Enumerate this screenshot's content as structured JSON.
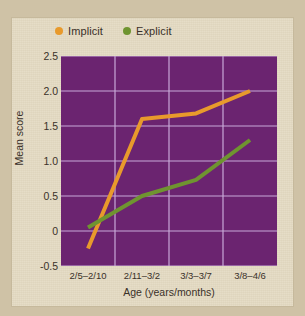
{
  "chart_data": {
    "type": "line",
    "title": "",
    "xlabel": "Age (years/months)",
    "ylabel": "Mean score",
    "categories": [
      "2/5–2/10",
      "2/11–3/2",
      "3/3–3/7",
      "3/8–4/6"
    ],
    "yticks": [
      "2.5",
      "2.0",
      "1.5",
      "1.0",
      "0.5",
      "0",
      "-0.5"
    ],
    "ytick_values": [
      2.5,
      2.0,
      1.5,
      1.0,
      0.5,
      0,
      -0.5
    ],
    "ylim": [
      -0.5,
      2.5
    ],
    "grid": true,
    "legend_position": "top-left",
    "plot_background": "#6b2470",
    "grid_color": "#c8a8d8",
    "series": [
      {
        "name": "Implicit",
        "color": "#e89a2c",
        "values": [
          -0.25,
          1.6,
          1.68,
          2.0
        ]
      },
      {
        "name": "Explicit",
        "color": "#6f9430",
        "values": [
          0.05,
          0.5,
          0.73,
          1.3
        ]
      }
    ]
  },
  "legend": {
    "items": [
      {
        "label": "Implicit",
        "color": "#e89a2c",
        "dot": "legend-dot-implicit"
      },
      {
        "label": "Explicit",
        "color": "#6f9430",
        "dot": "legend-dot-explicit"
      }
    ]
  },
  "axes": {
    "y_title": "Mean score",
    "x_title": "Age (years/months)"
  }
}
